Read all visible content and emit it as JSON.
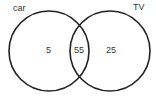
{
  "diagram": {
    "type": "venn",
    "sets": [
      {
        "label": "car",
        "only_value": "5"
      },
      {
        "label": "TV",
        "only_value": "25"
      }
    ],
    "intersection_value": "55",
    "stroke_color": "#222222"
  }
}
